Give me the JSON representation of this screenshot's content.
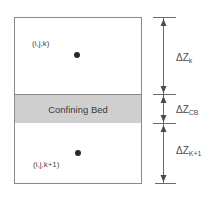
{
  "diagram": {
    "layers": [
      {
        "id": "upper-cell",
        "node_label": "(i,j,k)"
      },
      {
        "id": "confining-bed",
        "label": "Confining Bed"
      },
      {
        "id": "lower-cell",
        "node_label": "(i,j,k+1)"
      }
    ],
    "dimensions": [
      {
        "id": "dz-k",
        "delta": "ΔZ",
        "subscript": "k"
      },
      {
        "id": "dz-cb",
        "delta": "ΔZ",
        "subscript": "CB"
      },
      {
        "id": "dz-k1",
        "delta": "ΔZ",
        "subscript": "K+1"
      }
    ],
    "colors": {
      "bed_fill": "#cfcfcf",
      "outline": "#8a8a8a",
      "node": "#2a2a2a"
    }
  }
}
